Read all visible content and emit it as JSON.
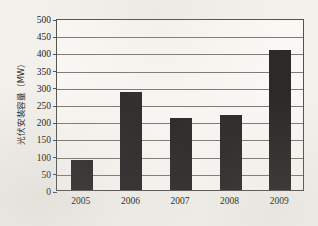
{
  "chart_data": {
    "type": "bar",
    "title": "",
    "xlabel": "",
    "ylabel": "光伏安装容量（MW）",
    "categories": [
      "2005",
      "2006",
      "2007",
      "2008",
      "2009"
    ],
    "values": [
      88,
      285,
      208,
      218,
      408
    ],
    "series": [
      {
        "name": "光伏安装容量",
        "values": [
          88,
          285,
          208,
          218,
          408
        ]
      }
    ],
    "ylim": [
      0,
      500
    ],
    "ytick_labels": [
      "500",
      "450",
      "400",
      "350",
      "300",
      "250",
      "200",
      "150",
      "100",
      "50",
      "0"
    ],
    "ytick_values": [
      500,
      450,
      400,
      350,
      300,
      250,
      200,
      150,
      100,
      50,
      0
    ],
    "ytick_step": 50,
    "grid": true,
    "grid_axis": "y",
    "legend": false,
    "legend_position": "none",
    "bar_color": "#2b2a29",
    "gridline_color": "#7d7b76",
    "axis_color": "#55534e",
    "plot_background": "#faf8f4",
    "page_background": "#f3f1ec",
    "text_color": "#232322"
  }
}
